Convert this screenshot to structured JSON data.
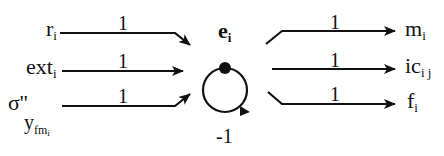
{
  "diagram": {
    "node": {
      "label": "e",
      "subscript": "i",
      "self_loop_weight": "-1"
    },
    "inputs": [
      {
        "label": "r",
        "subscript": "i",
        "weight": "1"
      },
      {
        "label": "ext",
        "subscript": "i",
        "weight": "1"
      },
      {
        "label": "σ''",
        "subscript": "y",
        "subsubscript": "fm",
        "subsubsubscript": "i",
        "weight": "1"
      }
    ],
    "outputs": [
      {
        "label": "m",
        "subscript": "i",
        "weight": "1"
      },
      {
        "label": "ic",
        "subscript": "i j",
        "weight": "1"
      },
      {
        "label": "f",
        "subscript": "i",
        "weight": "1"
      }
    ],
    "colors": {
      "stroke": "#111111",
      "background": "#ffffff"
    }
  }
}
